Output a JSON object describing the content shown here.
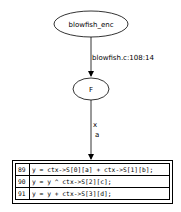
{
  "graph": {
    "nodes": [
      {
        "id": "blowfish_enc",
        "label": "blowfish_enc",
        "shape": "ellipse"
      },
      {
        "id": "F",
        "label": "F",
        "shape": "ellipse"
      },
      {
        "id": "code",
        "label": "code-block",
        "shape": "table"
      }
    ],
    "edges": [
      {
        "from": "blowfish_enc",
        "to": "F",
        "label": "blowfish.c:108:14"
      },
      {
        "from": "F",
        "to": "code",
        "labels": [
          "x",
          "a"
        ]
      }
    ]
  },
  "nodes": {
    "root": {
      "label": "blowfish_enc"
    },
    "f": {
      "label": "F"
    }
  },
  "edges": {
    "e1": {
      "label": "blowfish.c:108:14"
    },
    "e2": {
      "label_1": "x",
      "label_2": "a"
    }
  },
  "code_block": {
    "rows": [
      {
        "line": "89",
        "code": "y = ctx->S[0][a] + ctx->S[1][b];"
      },
      {
        "line": "90",
        "code": "y = y ^ ctx->S[2][c];"
      },
      {
        "line": "91",
        "code": "y = y + ctx->S[3][d];"
      }
    ]
  },
  "colors": {
    "stroke": "#000000",
    "background": "#ffffff"
  }
}
